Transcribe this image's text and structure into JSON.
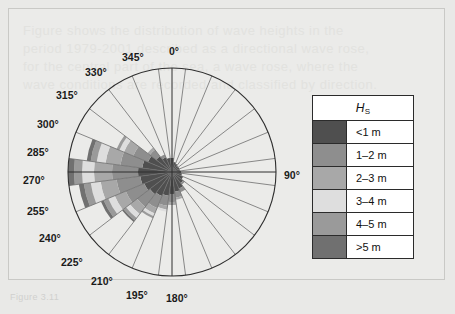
{
  "figure": {
    "caption": "Figure 3.11",
    "background_color": "#e9e9e7",
    "frame_color": "#c9c9c6"
  },
  "legend": {
    "title": "H",
    "title_sub": "S",
    "name": "significant wave height legend",
    "rows": [
      {
        "label": "<1 m",
        "color": "#4f4f4f"
      },
      {
        "label": "1–2 m",
        "color": "#8e8e8e"
      },
      {
        "label": "2–3 m",
        "color": "#a8a8a8"
      },
      {
        "label": "3–4 m",
        "color": "#dedede"
      },
      {
        "label": "4–5 m",
        "color": "#9a9a9a"
      },
      {
        "label": "&gt;5 m",
        "color": "#707070"
      }
    ]
  },
  "polar": {
    "center_x": 163,
    "center_y": 163,
    "radius": 104,
    "sector_count": 24,
    "sector_width_deg": 15,
    "grid_color": "#6d6d6d",
    "labels": [
      {
        "text": "0°",
        "angle": 0,
        "x": 160,
        "y": 36
      },
      {
        "text": "345°",
        "angle": 345,
        "x": 113,
        "y": 42
      },
      {
        "text": "330°",
        "angle": 330,
        "x": 76,
        "y": 57
      },
      {
        "text": "315°",
        "angle": 315,
        "x": 47,
        "y": 80
      },
      {
        "text": "300°",
        "angle": 300,
        "x": 28,
        "y": 109
      },
      {
        "text": "285°",
        "angle": 285,
        "x": 18,
        "y": 137
      },
      {
        "text": "270°",
        "angle": 270,
        "x": 14,
        "y": 165
      },
      {
        "text": "255°",
        "angle": 255,
        "x": 18,
        "y": 196
      },
      {
        "text": "240°",
        "angle": 240,
        "x": 30,
        "y": 223
      },
      {
        "text": "225°",
        "angle": 225,
        "x": 52,
        "y": 247
      },
      {
        "text": "210°",
        "angle": 210,
        "x": 82,
        "y": 266
      },
      {
        "text": "195°",
        "angle": 195,
        "x": 117,
        "y": 280
      },
      {
        "text": "180°",
        "angle": 180,
        "x": 157,
        "y": 283
      },
      {
        "text": "90°",
        "angle": 90,
        "x": 275,
        "y": 160
      }
    ]
  },
  "chart_data": {
    "type": "wind_rose",
    "title": "",
    "xlabel": "",
    "ylabel": "",
    "direction_unit": "degrees",
    "radial_unit": "relative frequency",
    "sector_width_deg": 15,
    "bin_labels": [
      "<1 m",
      "1–2 m",
      "2–3 m",
      "3–4 m",
      "4–5 m",
      ">5 m"
    ],
    "bin_colors": [
      "#4f4f4f",
      "#8e8e8e",
      "#a8a8a8",
      "#dedede",
      "#9a9a9a",
      "#707070"
    ],
    "rmax": 104,
    "directions": [
      0,
      15,
      30,
      45,
      60,
      75,
      90,
      105,
      120,
      135,
      150,
      165,
      180,
      195,
      210,
      225,
      240,
      255,
      270,
      285,
      300,
      315,
      330,
      345
    ],
    "stacks": [
      {
        "dir": 0,
        "values": [
          14,
          0,
          0,
          0,
          0,
          0
        ]
      },
      {
        "dir": 15,
        "values": [
          10,
          0,
          0,
          0,
          0,
          0
        ]
      },
      {
        "dir": 30,
        "values": [
          9,
          0,
          0,
          0,
          0,
          0
        ]
      },
      {
        "dir": 45,
        "values": [
          8,
          0,
          0,
          0,
          0,
          0
        ]
      },
      {
        "dir": 60,
        "values": [
          8,
          0,
          0,
          0,
          0,
          0
        ]
      },
      {
        "dir": 75,
        "values": [
          8,
          0,
          0,
          0,
          0,
          0
        ]
      },
      {
        "dir": 90,
        "values": [
          9,
          0,
          0,
          0,
          0,
          0
        ]
      },
      {
        "dir": 105,
        "values": [
          10,
          0,
          0,
          0,
          0,
          0
        ]
      },
      {
        "dir": 120,
        "values": [
          12,
          0,
          0,
          0,
          0,
          0
        ]
      },
      {
        "dir": 135,
        "values": [
          14,
          2,
          0,
          0,
          0,
          0
        ]
      },
      {
        "dir": 150,
        "values": [
          18,
          4,
          0,
          0,
          0,
          0
        ]
      },
      {
        "dir": 165,
        "values": [
          20,
          6,
          2,
          0,
          0,
          0
        ]
      },
      {
        "dir": 180,
        "values": [
          22,
          8,
          3,
          0,
          0,
          0
        ]
      },
      {
        "dir": 195,
        "values": [
          24,
          10,
          4,
          2,
          0,
          0
        ]
      },
      {
        "dir": 210,
        "values": [
          26,
          13,
          6,
          3,
          2,
          0
        ]
      },
      {
        "dir": 225,
        "values": [
          28,
          16,
          9,
          5,
          3,
          2
        ]
      },
      {
        "dir": 240,
        "values": [
          30,
          20,
          12,
          7,
          5,
          3
        ]
      },
      {
        "dir": 255,
        "values": [
          32,
          24,
          16,
          10,
          7,
          5
        ]
      },
      {
        "dir": 270,
        "values": [
          34,
          26,
          18,
          12,
          8,
          6
        ]
      },
      {
        "dir": 285,
        "values": [
          30,
          22,
          15,
          9,
          6,
          4
        ]
      },
      {
        "dir": 300,
        "values": [
          26,
          16,
          10,
          5,
          3,
          0
        ]
      },
      {
        "dir": 315,
        "values": [
          20,
          8,
          3,
          0,
          0,
          0
        ]
      },
      {
        "dir": 330,
        "values": [
          16,
          3,
          0,
          0,
          0,
          0
        ]
      },
      {
        "dir": 345,
        "values": [
          14,
          0,
          0,
          0,
          0,
          0
        ]
      }
    ]
  },
  "background_text": {
    "lines": [
      "Figure shows the distribution of wave heights in the",
      "period 1979-2001 described as a directional wave rose,",
      "for the central part of the sea, a wave rose, where the",
      "wave conditions are recorded and classified by direction."
    ]
  }
}
